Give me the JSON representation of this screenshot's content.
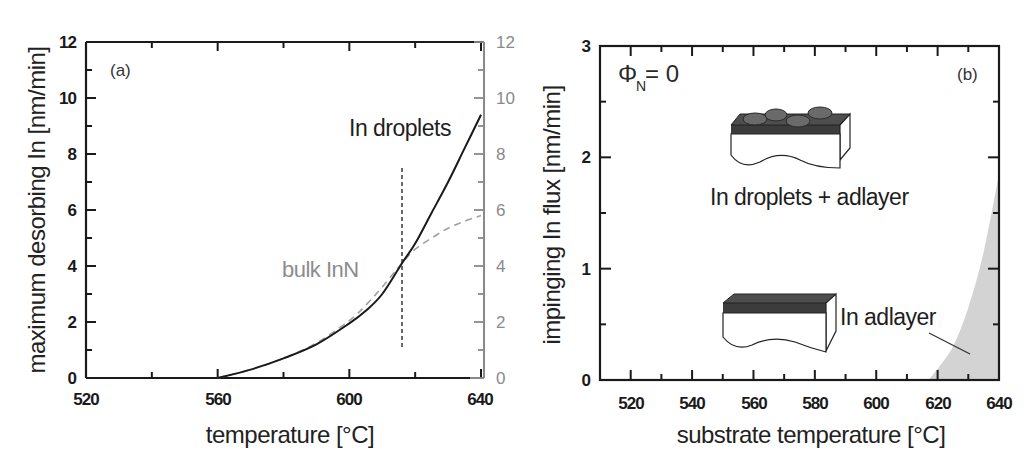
{
  "chart_data": [
    {
      "panel": "(a)",
      "type": "line",
      "title": "",
      "xlabel": "temperature [°C]",
      "ylabel": "maximum desorbing In [nm/min]",
      "xlim": [
        520,
        640
      ],
      "ylim": [
        0,
        12
      ],
      "x_ticks": [
        520,
        560,
        600,
        640
      ],
      "y_ticks": [
        0,
        2,
        4,
        6,
        8,
        10,
        12
      ],
      "y2_ticks": [
        0,
        2,
        4,
        6,
        8,
        10,
        12
      ],
      "y2_color": "#8a8a8a",
      "grid": false,
      "series": [
        {
          "name": "In droplets",
          "style": "solid",
          "color": "#1a1a1a",
          "x": [
            560,
            570,
            580,
            590,
            600,
            605,
            610,
            616,
            620,
            625,
            630,
            635,
            640
          ],
          "y": [
            0.0,
            0.3,
            0.7,
            1.2,
            1.95,
            2.4,
            3.0,
            4.1,
            4.8,
            5.9,
            7.0,
            8.2,
            9.4
          ]
        },
        {
          "name": "bulk InN",
          "style": "dashed",
          "color": "#9a9a9a",
          "x": [
            560,
            570,
            580,
            590,
            600,
            605,
            610,
            616,
            620,
            625,
            630,
            635,
            640
          ],
          "y": [
            0.0,
            0.3,
            0.7,
            1.25,
            2.05,
            2.6,
            3.25,
            4.1,
            4.6,
            5.0,
            5.35,
            5.6,
            5.8
          ]
        }
      ],
      "vertical_marker": {
        "x": 616,
        "y_from": 1.0,
        "y_to": 7.5,
        "style": "dashed"
      },
      "annotations": [
        "(a)",
        "In droplets",
        "bulk InN"
      ]
    },
    {
      "panel": "(b)",
      "type": "area",
      "title": "",
      "xlabel": "substrate temperature [°C]",
      "ylabel": "impinging In flux [nm/min]",
      "xlim": [
        510,
        640
      ],
      "ylim": [
        0,
        3
      ],
      "x_ticks": [
        520,
        540,
        560,
        580,
        600,
        620,
        640
      ],
      "y_ticks": [
        0,
        1,
        2,
        3
      ],
      "grid": false,
      "series": [
        {
          "name": "In adlayer region boundary",
          "style": "filled",
          "color": "#d3d3d3",
          "x": [
            617,
            620,
            625,
            630,
            635,
            640
          ],
          "y": [
            0.0,
            0.1,
            0.3,
            0.65,
            1.15,
            1.85
          ]
        }
      ],
      "annotations": [
        "ΦN = 0",
        "(b)",
        "In droplets + adlayer",
        "In adlayer"
      ]
    }
  ],
  "panel_a": {
    "tag": "(a)",
    "xlabel": "temperature [°C]",
    "ylabel": "maximum desorbing In [nm/min]",
    "x_tick_labels": [
      "520",
      "560",
      "600",
      "640"
    ],
    "y_tick_labels": [
      "0",
      "2",
      "4",
      "6",
      "8",
      "10",
      "12"
    ],
    "y2_tick_labels": [
      "0",
      "2",
      "4",
      "6",
      "8",
      "10",
      "12"
    ],
    "label_droplets": "In droplets",
    "label_bulk": "bulk InN"
  },
  "panel_b": {
    "tag": "(b)",
    "xlabel": "substrate temperature [°C]",
    "ylabel": "impinging In flux [nm/min]",
    "x_tick_labels": [
      "520",
      "540",
      "560",
      "580",
      "600",
      "620",
      "640"
    ],
    "y_tick_labels": [
      "0",
      "1",
      "2",
      "3"
    ],
    "phi_symbol": "Φ",
    "phi_sub": "N",
    "phi_value": "= 0",
    "label_droplets_adlayer": "In droplets + adlayer",
    "label_adlayer": "In adlayer"
  },
  "colors": {
    "axis": "#1a1a1a",
    "secondary_axis": "#8a8a8a",
    "dashed_curve": "#9a9a9a",
    "shaded_region": "#d3d3d3",
    "schematic_top": "#4a4a4a",
    "droplet": "#6a6a6a"
  }
}
